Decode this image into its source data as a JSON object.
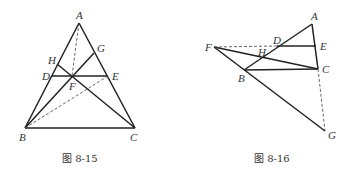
{
  "figures": [
    {
      "caption": "图 8-15",
      "points": {
        "A": [
          79,
          23
        ],
        "B": [
          25,
          128
        ],
        "C": [
          135,
          128
        ],
        "D": [
          52,
          76
        ],
        "E": [
          108,
          76
        ],
        "F": [
          72,
          76
        ],
        "H": [
          57,
          64
        ],
        "G": [
          94,
          53
        ]
      },
      "labels": {
        "A": "A",
        "B": "B",
        "C": "C",
        "D": "D",
        "E": "E",
        "F": "F",
        "G": "G",
        "H": "H"
      },
      "solid_segments": [
        [
          "A",
          "B"
        ],
        [
          "A",
          "C"
        ],
        [
          "B",
          "C"
        ],
        [
          "D",
          "E"
        ],
        [
          "B",
          "G"
        ],
        [
          "C",
          "H"
        ]
      ],
      "dashed_segments": [
        [
          "A",
          "F"
        ],
        [
          "B",
          "E"
        ]
      ]
    },
    {
      "caption": "图 8-16",
      "points": {
        "A": [
          312,
          24
        ],
        "E": [
          316,
          46
        ],
        "C": [
          318,
          69
        ],
        "F": [
          214,
          47
        ],
        "D": [
          277,
          46
        ],
        "H": [
          262,
          57
        ],
        "B": [
          244,
          70
        ],
        "G": [
          325,
          131
        ]
      },
      "labels": {
        "A": "A",
        "B": "B",
        "C": "C",
        "D": "D",
        "E": "E",
        "F": "F",
        "G": "G",
        "H": "H"
      },
      "solid_segments": [
        [
          "A",
          "B"
        ],
        [
          "A",
          "C"
        ],
        [
          "D",
          "E"
        ],
        [
          "B",
          "C"
        ],
        [
          "F",
          "C"
        ],
        [
          "F",
          "G"
        ]
      ],
      "dashed_segments": [
        [
          "F",
          "D"
        ],
        [
          "C",
          "G"
        ]
      ]
    }
  ]
}
